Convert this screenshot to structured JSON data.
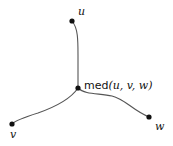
{
  "diagram": {
    "nodes": {
      "u": {
        "label": "u",
        "x": 72,
        "y": 21
      },
      "v": {
        "label": "v",
        "x": 12,
        "y": 124
      },
      "w": {
        "label": "w",
        "x": 149,
        "y": 117
      },
      "med": {
        "label": "med(u, v, w)",
        "label_prefix": "med",
        "label_args": "(u, v, w)",
        "x": 78,
        "y": 88
      }
    },
    "edges": [
      {
        "from": "u",
        "to": "med"
      },
      {
        "from": "med",
        "to": "v"
      },
      {
        "from": "med",
        "to": "w"
      }
    ],
    "colors": {
      "edge": "#555555",
      "node": "#111111",
      "text": "#111111",
      "background": "#ffffff"
    }
  }
}
